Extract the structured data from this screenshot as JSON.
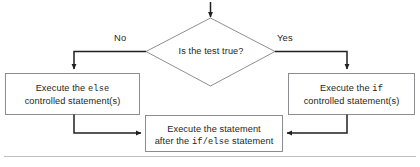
{
  "diagram": {
    "colors": {
      "stroke": "#231f20",
      "box_border": "#808285",
      "rule": "#bcbec0",
      "text": "#231f20",
      "background": "#ffffff"
    },
    "decision": {
      "name": "is-the-test-true",
      "text": "Is the test true?"
    },
    "edge_labels": {
      "no": "No",
      "yes": "Yes"
    },
    "boxes": {
      "else_branch": {
        "line1_prefix": "Execute the ",
        "line1_code": "else",
        "line2": "controlled statement(s)"
      },
      "if_branch": {
        "line1_prefix": "Execute the ",
        "line1_code": "if",
        "line2": "controlled statement(s)"
      },
      "after": {
        "line1": "Execute the statement",
        "line2_prefix": "after the ",
        "line2_code_if": "if",
        "line2_slash": "/",
        "line2_code_else": "else",
        "line2_suffix": " statement"
      }
    }
  }
}
